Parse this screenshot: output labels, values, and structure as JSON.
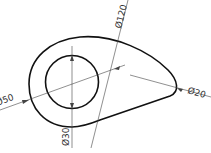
{
  "drawing": {
    "dimensions": {
      "outer_left_diameter": "Ø50",
      "inner_circle_diameter": "Ø30",
      "right_end_diameter": "Ø20",
      "overall_diameter": "Ø120"
    },
    "colors": {
      "outline": "#111111",
      "dimension_line": "#444444"
    }
  }
}
